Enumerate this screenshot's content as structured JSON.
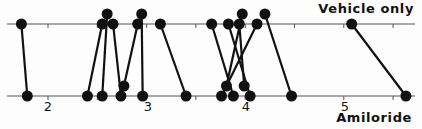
{
  "chart_data": {
    "type": "paired-dot",
    "title": "",
    "rows": [
      {
        "name": "Vehicle only",
        "position": "top"
      },
      {
        "name": "Amiloride",
        "position": "bottom"
      }
    ],
    "xlabel": "",
    "xlim": [
      1.6,
      5.75
    ],
    "xticks": [
      2,
      3,
      4,
      5
    ],
    "minor_ticks": [
      1.5,
      2.5,
      3.5,
      4.5,
      5.5
    ],
    "pairs": [
      {
        "vehicle": 1.73,
        "amiloride": 1.79
      },
      {
        "vehicle": 2.55,
        "amiloride": 2.4
      },
      {
        "vehicle": 2.6,
        "amiloride": 2.55
      },
      {
        "vehicle": 2.66,
        "amiloride": 2.74
      },
      {
        "vehicle": 2.91,
        "amiloride": 2.77
      },
      {
        "vehicle": 2.95,
        "amiloride": 2.96
      },
      {
        "vehicle": 3.14,
        "amiloride": 3.4
      },
      {
        "vehicle": 3.66,
        "amiloride": 3.88
      },
      {
        "vehicle": 3.83,
        "amiloride": 4.05
      },
      {
        "vehicle": 3.94,
        "amiloride": 3.99
      },
      {
        "vehicle": 3.97,
        "amiloride": 3.81
      },
      {
        "vehicle": 4.12,
        "amiloride": 3.76
      },
      {
        "vehicle": 4.2,
        "amiloride": 4.47
      },
      {
        "vehicle": 5.08,
        "amiloride": 5.63
      }
    ]
  },
  "labels": {
    "top_row": "Vehicle only",
    "bottom_row": "Amiloride",
    "ticks": [
      "2",
      "3",
      "4",
      "5"
    ]
  },
  "style": {
    "ink": "#111111",
    "axis": "#555555",
    "background": "#fdfdfd"
  }
}
